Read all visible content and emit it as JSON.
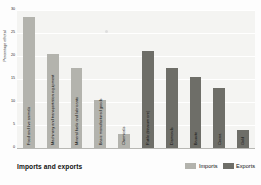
{
  "caption": "Imports and exports",
  "legend": {
    "position": "bottom-right",
    "items": [
      {
        "label": "Imports",
        "color": "#b3b3ad"
      },
      {
        "label": "Exports",
        "color": "#6e6e68"
      }
    ]
  },
  "chart_data": {
    "type": "bar",
    "title": "Imports and exports",
    "xlabel": "",
    "ylabel": "Percentage of total",
    "ylim": [
      0,
      30
    ],
    "yticks": [
      0,
      5,
      10,
      15,
      20,
      25,
      30
    ],
    "ytick_labels": [
      "0",
      "5",
      "10",
      "15",
      "20",
      "25",
      "30"
    ],
    "grid": true,
    "legend_entries": [
      "Imports",
      "Exports"
    ],
    "categories": [
      "Food and live animals",
      "Machinery and transportation equipment",
      "Mineral fuels and lubricants",
      "Basic manufactured goods",
      "Chemicals",
      "Rutile (titanium ore)",
      "Diamonds",
      "Bauxite",
      "Cocoa",
      "Gold"
    ],
    "series": [
      {
        "name": "Imports",
        "color": "#b3b3ad",
        "values": [
          28.5,
          20.5,
          17.5,
          10.5,
          3.0,
          null,
          null,
          null,
          null,
          null
        ]
      },
      {
        "name": "Exports",
        "color": "#6e6e68",
        "values": [
          null,
          null,
          null,
          null,
          null,
          21.0,
          17.5,
          15.5,
          13.0,
          4.0
        ]
      }
    ],
    "bars": [
      {
        "category": "Food and live animals",
        "series": "Imports",
        "value": 28.5
      },
      {
        "category": "Machinery and transportation equipment",
        "series": "Imports",
        "value": 20.5
      },
      {
        "category": "Mineral fuels and lubricants",
        "series": "Imports",
        "value": 17.5
      },
      {
        "category": "Basic manufactured goods",
        "series": "Imports",
        "value": 10.5
      },
      {
        "category": "Chemicals",
        "series": "Imports",
        "value": 3.0
      },
      {
        "category": "Rutile (titanium ore)",
        "series": "Exports",
        "value": 21.0
      },
      {
        "category": "Diamonds",
        "series": "Exports",
        "value": 17.5
      },
      {
        "category": "Bauxite",
        "series": "Exports",
        "value": 15.5
      },
      {
        "category": "Cocoa",
        "series": "Exports",
        "value": 13.0
      },
      {
        "category": "Gold",
        "series": "Exports",
        "value": 4.0
      }
    ]
  }
}
